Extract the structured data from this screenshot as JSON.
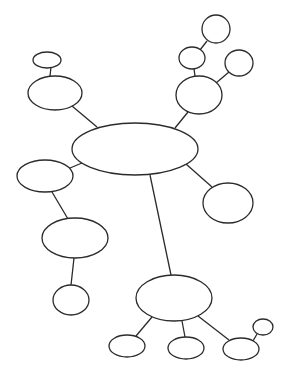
{
  "diagram": {
    "type": "mind-map",
    "colors": {
      "stroke": "#2b2b2b",
      "fill": "#ffffff",
      "background": "#ffffff"
    },
    "nodes": [
      {
        "id": "center",
        "cx": 135,
        "cy": 149,
        "rx": 63,
        "ry": 26,
        "label": ""
      },
      {
        "id": "upper-left-small",
        "cx": 47,
        "cy": 60,
        "rx": 14,
        "ry": 8,
        "label": ""
      },
      {
        "id": "upper-left-medium",
        "cx": 55,
        "cy": 93,
        "rx": 27,
        "ry": 17,
        "label": ""
      },
      {
        "id": "upper-right-medium",
        "cx": 199,
        "cy": 95,
        "rx": 23,
        "ry": 19,
        "label": ""
      },
      {
        "id": "upper-right-mid-small",
        "cx": 192,
        "cy": 58,
        "rx": 13,
        "ry": 11,
        "label": ""
      },
      {
        "id": "upper-right-top",
        "cx": 216,
        "cy": 29,
        "rx": 14,
        "ry": 14,
        "label": ""
      },
      {
        "id": "upper-right-side",
        "cx": 239,
        "cy": 63,
        "rx": 14,
        "ry": 13,
        "label": ""
      },
      {
        "id": "right-circle",
        "cx": 228,
        "cy": 203,
        "rx": 25,
        "ry": 20,
        "label": ""
      },
      {
        "id": "left-small",
        "cx": 45,
        "cy": 176,
        "rx": 28,
        "ry": 16,
        "label": ""
      },
      {
        "id": "left-lower-medium",
        "cx": 75,
        "cy": 238,
        "rx": 33,
        "ry": 20,
        "label": ""
      },
      {
        "id": "left-bottom",
        "cx": 71,
        "cy": 300,
        "rx": 18,
        "ry": 15,
        "label": ""
      },
      {
        "id": "bottom-hub",
        "cx": 174,
        "cy": 298,
        "rx": 38,
        "ry": 23,
        "label": ""
      },
      {
        "id": "bottom-left",
        "cx": 127,
        "cy": 346,
        "rx": 18,
        "ry": 11,
        "label": ""
      },
      {
        "id": "bottom-middle",
        "cx": 186,
        "cy": 348,
        "rx": 18,
        "ry": 11,
        "label": ""
      },
      {
        "id": "bottom-right",
        "cx": 241,
        "cy": 349,
        "rx": 18,
        "ry": 11,
        "label": ""
      },
      {
        "id": "bottom-right-tiny",
        "cx": 263,
        "cy": 327,
        "rx": 10,
        "ry": 8,
        "label": ""
      }
    ],
    "edges": [
      {
        "from": "upper-left-small",
        "to": "upper-left-medium",
        "x1": 51,
        "y1": 67,
        "x2": 50,
        "y2": 76
      },
      {
        "from": "upper-left-medium",
        "to": "center",
        "x1": 72,
        "y1": 106,
        "x2": 97,
        "y2": 127
      },
      {
        "from": "center",
        "to": "upper-right-medium",
        "x1": 175,
        "y1": 128,
        "x2": 188,
        "y2": 112
      },
      {
        "from": "upper-right-medium",
        "to": "upper-right-mid-small",
        "x1": 195,
        "y1": 76,
        "x2": 194,
        "y2": 69
      },
      {
        "from": "upper-right-mid-small",
        "to": "upper-right-top",
        "x1": 200,
        "y1": 50,
        "x2": 207,
        "y2": 41
      },
      {
        "from": "upper-right-medium",
        "to": "upper-right-side",
        "x1": 216,
        "y1": 83,
        "x2": 229,
        "y2": 72
      },
      {
        "from": "center",
        "to": "right-circle",
        "x1": 186,
        "y1": 164,
        "x2": 212,
        "y2": 187
      },
      {
        "from": "center",
        "to": "left-small",
        "x1": 82,
        "y1": 163,
        "x2": 70,
        "y2": 168
      },
      {
        "from": "left-small",
        "to": "left-lower-medium",
        "x1": 52,
        "y1": 192,
        "x2": 68,
        "y2": 219
      },
      {
        "from": "left-lower-medium",
        "to": "left-bottom",
        "x1": 74,
        "y1": 258,
        "x2": 71,
        "y2": 285
      },
      {
        "from": "center",
        "to": "bottom-hub",
        "x1": 150,
        "y1": 175,
        "x2": 171,
        "y2": 275
      },
      {
        "from": "bottom-hub",
        "to": "bottom-left",
        "x1": 152,
        "y1": 317,
        "x2": 136,
        "y2": 336
      },
      {
        "from": "bottom-hub",
        "to": "bottom-middle",
        "x1": 182,
        "y1": 321,
        "x2": 185,
        "y2": 337
      },
      {
        "from": "bottom-hub",
        "to": "bottom-right",
        "x1": 198,
        "y1": 316,
        "x2": 229,
        "y2": 340
      },
      {
        "from": "bottom-right",
        "to": "bottom-right-tiny",
        "x1": 253,
        "y1": 341,
        "x2": 257,
        "y2": 334
      }
    ]
  }
}
